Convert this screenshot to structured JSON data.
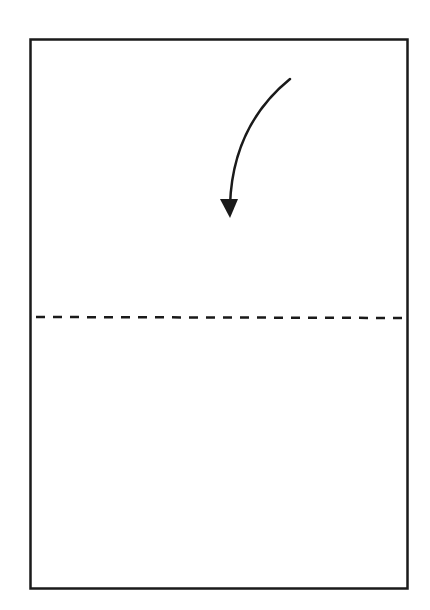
{
  "diagram": {
    "type": "folding-instruction",
    "colors": {
      "stroke": "#1a1a1a",
      "background": "#ffffff"
    },
    "paper": {
      "x": 30,
      "y": 39,
      "width": 377,
      "height": 549
    },
    "fold_line": {
      "y": 317,
      "style": "dashed",
      "type": "valley-fold"
    },
    "arrow": {
      "direction": "down",
      "meaning": "fold-top-edge-down"
    }
  }
}
